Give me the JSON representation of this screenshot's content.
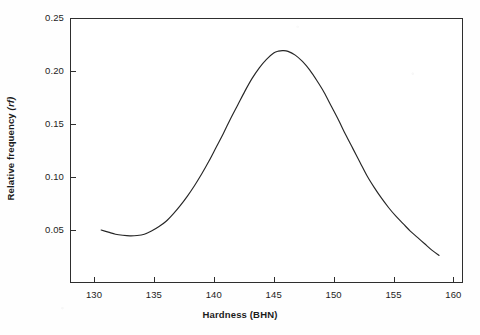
{
  "chart_data": {
    "type": "line",
    "title": "",
    "subtitle": "",
    "xlabel": "Hardness (BHN)",
    "ylabel": "Relative frequency (rf)",
    "ylabel_plain": "Relative frequency",
    "ylabel_italic_part": "(rf)",
    "xlim": [
      128.0,
      160.8
    ],
    "ylim": [
      0.0,
      0.25
    ],
    "grid": false,
    "legend": false,
    "legend_position": "none",
    "xticks": [
      130,
      135,
      140,
      145,
      150,
      155,
      160
    ],
    "xticklabels": [
      "130",
      "135",
      "140",
      "145",
      "150",
      "155",
      "160"
    ],
    "yticks": [
      0.05,
      0.1,
      0.15,
      0.2,
      0.25
    ],
    "yticklabels": [
      "0.05",
      "0.10",
      "0.15",
      "0.20",
      "0.25"
    ],
    "line_color": "#262626",
    "line_width": 1.1,
    "annotations": [],
    "series": [
      {
        "name": "Relative frequency distribution",
        "x": [
          130.6,
          131.2,
          131.8,
          132.4,
          133.0,
          133.6,
          134.2,
          134.8,
          135.4,
          136.0,
          136.6,
          137.2,
          137.8,
          138.4,
          139.0,
          139.6,
          140.2,
          140.8,
          141.4,
          142.0,
          142.6,
          143.2,
          143.8,
          144.4,
          145.0,
          145.4,
          145.8,
          146.2,
          146.8,
          147.4,
          148.0,
          148.6,
          149.2,
          149.8,
          150.4,
          151.0,
          151.6,
          152.2,
          152.8,
          153.4,
          154.0,
          154.6,
          155.2,
          155.8,
          156.4,
          157.0,
          157.6,
          158.2,
          158.8
        ],
        "y": [
          0.05,
          0.048,
          0.046,
          0.045,
          0.0445,
          0.0448,
          0.046,
          0.049,
          0.053,
          0.058,
          0.065,
          0.073,
          0.082,
          0.092,
          0.103,
          0.115,
          0.128,
          0.141,
          0.155,
          0.168,
          0.181,
          0.193,
          0.203,
          0.211,
          0.217,
          0.2188,
          0.2192,
          0.2185,
          0.215,
          0.209,
          0.201,
          0.191,
          0.18,
          0.167,
          0.154,
          0.14,
          0.127,
          0.114,
          0.101,
          0.09,
          0.08,
          0.071,
          0.063,
          0.056,
          0.049,
          0.043,
          0.037,
          0.031,
          0.026
        ]
      }
    ],
    "peak": {
      "x": 145.8,
      "y": 0.219
    },
    "start_point": {
      "x": 130.6,
      "y": 0.05
    },
    "end_point": {
      "x": 158.8,
      "y": 0.026
    }
  },
  "figure": {
    "frame_color": "#2e2e2e",
    "background": "#ffffff"
  }
}
